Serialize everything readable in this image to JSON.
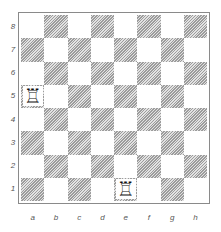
{
  "board": {
    "ranks": [
      "8",
      "7",
      "6",
      "5",
      "4",
      "3",
      "2",
      "1"
    ],
    "files": [
      "a",
      "b",
      "c",
      "d",
      "e",
      "f",
      "g",
      "h"
    ],
    "light_color": "#ffffff",
    "dark_color": "#9c9c9c hatched",
    "pieces": [
      {
        "square": "a5",
        "piece": "white-rook",
        "glyph": "♖"
      },
      {
        "square": "e1",
        "piece": "white-rook",
        "glyph": "♖"
      }
    ]
  }
}
